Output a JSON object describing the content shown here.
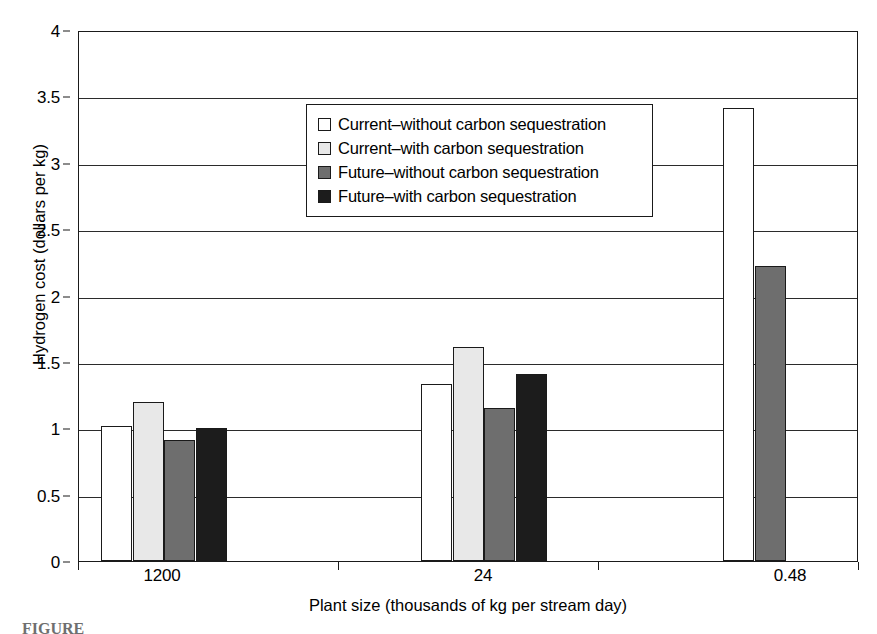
{
  "chart_data": {
    "type": "bar",
    "title": "",
    "xlabel": "Plant size (thousands of kg per stream day)",
    "ylabel": "Hydrogen cost (dollars per kg)",
    "categories": [
      "1200",
      "24",
      "0.48"
    ],
    "ylim": [
      0,
      4
    ],
    "yticks": [
      0,
      0.5,
      1,
      1.5,
      2,
      2.5,
      3,
      3.5,
      4
    ],
    "ytick_labels": [
      "0",
      "0.5",
      "1",
      "1.5",
      "2",
      "2.5",
      "3",
      "3.5",
      "4"
    ],
    "grid": true,
    "legend_position": "upper-center-left",
    "series": [
      {
        "name": "Current–without carbon sequestration",
        "color": "#ffffff",
        "values": [
          1.02,
          1.33,
          3.41
        ]
      },
      {
        "name": "Current–with carbon sequestration",
        "color": "#e8e8e8",
        "values": [
          1.2,
          1.61,
          null
        ]
      },
      {
        "name": "Future–without carbon sequestration",
        "color": "#6e6e6e",
        "values": [
          0.91,
          1.15,
          2.22
        ]
      },
      {
        "name": "Future–with carbon sequestration",
        "color": "#1c1c1c",
        "values": [
          1.0,
          1.41,
          null
        ]
      }
    ]
  },
  "legend": {
    "items": [
      {
        "label": "Current–without carbon sequestration",
        "swatch": "swatch-white"
      },
      {
        "label": "Current–with carbon sequestration",
        "swatch": "swatch-light"
      },
      {
        "label": "Future–without carbon sequestration",
        "swatch": "swatch-mid"
      },
      {
        "label": "Future–with carbon sequestration",
        "swatch": "swatch-dark"
      }
    ]
  },
  "caption": {
    "text": "FIGURE"
  }
}
